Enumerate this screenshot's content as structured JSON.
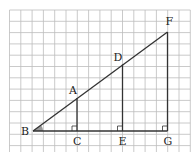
{
  "diagram": {
    "grid": {
      "x0": 9.5,
      "y0": 10,
      "cell": 11.3,
      "cols": 16,
      "rows": 12.6,
      "color": "#bdbdbd"
    },
    "line_color": "#333333",
    "points": {
      "B": {
        "label": "B",
        "x": 33,
        "y": 131
      },
      "C": {
        "label": "C",
        "x": 77,
        "y": 131
      },
      "E": {
        "label": "E",
        "x": 122.5,
        "y": 131
      },
      "G": {
        "label": "G",
        "x": 167.5,
        "y": 131
      },
      "A": {
        "label": "A",
        "x": 77,
        "y": 98
      },
      "D": {
        "label": "D",
        "x": 122.5,
        "y": 64.5
      },
      "F": {
        "label": "F",
        "x": 167.5,
        "y": 32
      }
    },
    "angle_marker": "B",
    "right_angle_markers": [
      "C",
      "E",
      "G"
    ]
  }
}
